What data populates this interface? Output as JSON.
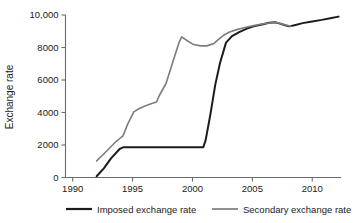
{
  "chart_data": {
    "type": "line",
    "title": "",
    "subtitle": "",
    "xlabel": "",
    "ylabel": "Exchange rate",
    "xlim": [
      1989.0,
      1990.0
    ],
    "ylim": [
      0,
      10000
    ],
    "grid": false,
    "legend_position": "bottom",
    "x_ticks": [
      1990,
      1995,
      2000,
      2005,
      2010
    ],
    "x_tick_labels": [
      "1990",
      "1995",
      "2000",
      "2005",
      "2010"
    ],
    "y_ticks": [
      0,
      2000,
      4000,
      6000,
      8000,
      10000
    ],
    "y_tick_labels": [
      "0",
      "2000",
      "4000",
      "6000",
      "8000",
      "10,000"
    ],
    "x_axis_start": 1989.4,
    "x_axis_end": 2012.4,
    "series": [
      {
        "name": "Imposed exchange rate",
        "color": "#1c1c1c",
        "width": 2.0,
        "x": [
          1992.0,
          1992.6,
          1993.2,
          1993.9,
          1994.2,
          2000.9,
          2001.1,
          2001.5,
          2001.9,
          2002.3,
          2002.8,
          2003.3,
          2003.9,
          2004.5,
          2005.1,
          2005.8,
          2006.4,
          2006.9,
          2007.3,
          2007.8,
          2008.1,
          2008.6,
          2009.2,
          2010.0,
          2010.8,
          2011.5,
          2012.2
        ],
        "y": [
          80,
          560,
          1180,
          1740,
          1860,
          1860,
          2300,
          3900,
          5700,
          7050,
          8300,
          8700,
          8950,
          9150,
          9300,
          9420,
          9520,
          9550,
          9470,
          9350,
          9300,
          9390,
          9500,
          9600,
          9700,
          9800,
          9900
        ]
      },
      {
        "name": "Secondary exchange rate",
        "color": "#7d7d7d",
        "width": 1.6,
        "x": [
          1992.0,
          1992.8,
          1993.6,
          1994.2,
          1994.6,
          1995.1,
          1995.6,
          1996.1,
          1996.6,
          1997.0,
          1997.2,
          1997.8,
          1998.4,
          1998.9,
          1999.1,
          1999.6,
          2000.1,
          2000.7,
          2001.2,
          2001.8,
          2002.1,
          2002.6,
          2003.1,
          2003.7,
          2004.3,
          2005.0,
          2005.7,
          2006.4,
          2006.9,
          2007.4,
          2007.9,
          2008.2
        ],
        "y": [
          1020,
          1600,
          2200,
          2560,
          3300,
          4040,
          4260,
          4420,
          4550,
          4650,
          5000,
          5800,
          7200,
          8350,
          8650,
          8400,
          8180,
          8100,
          8100,
          8250,
          8450,
          8750,
          8950,
          9100,
          9220,
          9330,
          9430,
          9510,
          9550,
          9470,
          9360,
          9310
        ]
      }
    ]
  },
  "legend": {
    "items": [
      {
        "label": "Imposed exchange rate",
        "color": "#1c1c1c"
      },
      {
        "label": "Secondary exchange rate",
        "color": "#7d7d7d"
      }
    ]
  },
  "axes": {
    "y_title": "Exchange rate"
  },
  "colors": {
    "imposed": "#1c1c1c",
    "secondary": "#7d7d7d",
    "axis": "#6b6b6b",
    "text": "#1a1a1a",
    "background": "#ffffff"
  }
}
